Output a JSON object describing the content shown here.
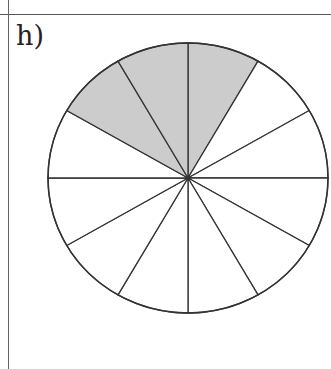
{
  "problem": {
    "label": "h)"
  },
  "figure": {
    "type": "fraction-circle",
    "total_sectors": 12,
    "shaded_sectors": 3,
    "shaded_fraction": "3/12",
    "shaded_positions": "sectors between 10 o'clock and 1 o'clock",
    "colors": {
      "shade": "#cccccc",
      "stroke": "#333333",
      "fill": "#ffffff"
    }
  }
}
